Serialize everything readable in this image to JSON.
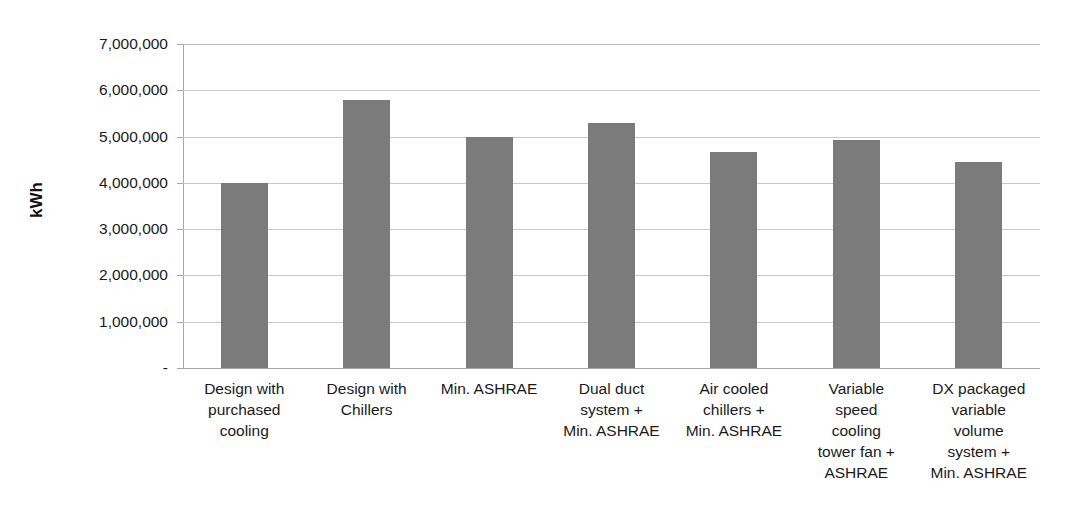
{
  "chart_data": {
    "type": "bar",
    "title": "",
    "subtitle": "",
    "xlabel": "",
    "ylabel": "kWh",
    "ylim": [
      0,
      7000000
    ],
    "ytick_step": 1000000,
    "ytick_labels": [
      "7,000,000",
      "6,000,000",
      "5,000,000",
      "4,000,000",
      "3,000,000",
      "2,000,000",
      "1,000,000",
      "-"
    ],
    "ytick_values": [
      7000000,
      6000000,
      5000000,
      4000000,
      3000000,
      2000000,
      1000000,
      0
    ],
    "grid": true,
    "grid_axis": "y",
    "legend": false,
    "legend_position": "none",
    "bar_color": "#7b7b7b",
    "gridline_color": "#c8c8c8",
    "axis_color": "#a6a6a6",
    "categories": [
      "Design with purchased cooling",
      "Design with Chillers",
      "Min. ASHRAE",
      "Dual duct system + Min. ASHRAE",
      "Air cooled chillers + Min. ASHRAE",
      "Variable speed cooling tower fan + ASHRAE",
      "DX packaged variable volume system + Min. ASHRAE"
    ],
    "category_label_lines": [
      [
        "Design with",
        "purchased",
        "cooling"
      ],
      [
        "Design with",
        "Chillers"
      ],
      [
        "Min. ASHRAE"
      ],
      [
        "Dual duct",
        "system +",
        "Min. ASHRAE"
      ],
      [
        "Air cooled",
        "chillers +",
        "Min. ASHRAE"
      ],
      [
        "Variable",
        "speed",
        "cooling",
        "tower fan +",
        "ASHRAE"
      ],
      [
        "DX packaged",
        "variable",
        "volume",
        "system +",
        "Min. ASHRAE"
      ]
    ],
    "values": [
      4000000,
      5790000,
      5000000,
      5300000,
      4670000,
      4930000,
      4440000
    ],
    "series": [
      {
        "name": "kWh",
        "values": [
          4000000,
          5790000,
          5000000,
          5300000,
          4670000,
          4930000,
          4440000
        ]
      }
    ]
  },
  "axis": {
    "y_title": "kWh",
    "zero_label": "-"
  }
}
